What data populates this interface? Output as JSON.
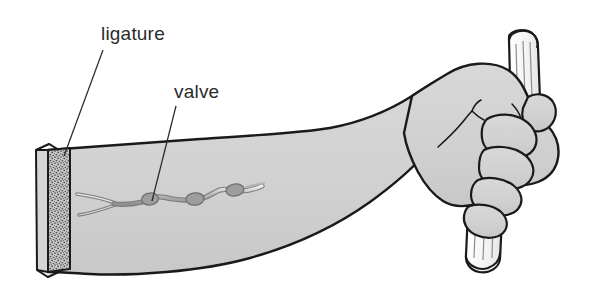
{
  "figure": {
    "background_color": "#ffffff",
    "skin_fill": "#d2d2d2",
    "outline_color": "#1a1a1a",
    "vein_fill": "#a8a8a8",
    "ligature_fill": "#8f8f8f",
    "rod_fill": "#efefef",
    "label_color": "#2b2b2b"
  },
  "annotations": {
    "ligature": {
      "label": "ligature",
      "icon": "leader-line-icon",
      "leader_from": [
        103,
        50
      ],
      "leader_to": [
        64,
        156
      ]
    },
    "valve": {
      "label": "valve",
      "icon": "leader-line-icon",
      "leader_from": [
        176,
        106
      ],
      "leader_to": [
        152,
        201
      ]
    }
  },
  "parts": {
    "forearm": "forearm",
    "hand": "clenched-fist",
    "rod": "wooden-rod",
    "vein": "superficial-vein",
    "valve_nodes": 4,
    "ligature_band": "stippled-band"
  }
}
